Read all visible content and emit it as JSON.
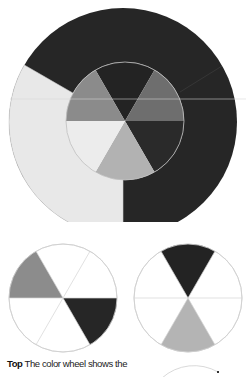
{
  "caption": {
    "lead": "Top",
    "text": " The color wheel shows the"
  },
  "colors": {
    "dark": "#252525",
    "dark_mid": "#2e2e2e",
    "mid_dark": "#6f6f6f",
    "mid": "#8a8a8a",
    "light_mid": "#b3b3b3",
    "light": "#e6e6e6",
    "outline": "#c8c8c8",
    "paper": "#ffffff"
  },
  "figures": {
    "main_wheel": {
      "outer_ring": [
        {
          "name": "dark-ring-segment",
          "shade": "dark"
        },
        {
          "name": "light-ring-segment",
          "shade": "light"
        }
      ],
      "inner_wedges": [
        {
          "position": "top",
          "shade": "dark"
        },
        {
          "position": "upper-right",
          "shade": "mid_dark"
        },
        {
          "position": "lower-right",
          "shade": "dark"
        },
        {
          "position": "bottom",
          "shade": "light_mid"
        },
        {
          "position": "lower-left",
          "shade": "light"
        },
        {
          "position": "upper-left",
          "shade": "mid"
        }
      ]
    },
    "small_wheel_left": {
      "filled_wedges": [
        {
          "position": "upper-left",
          "shade": "mid"
        },
        {
          "position": "lower-right",
          "shade": "dark"
        }
      ]
    },
    "small_wheel_right": {
      "filled_wedges": [
        {
          "position": "top",
          "shade": "dark"
        },
        {
          "position": "bottom",
          "shade": "light_mid"
        }
      ]
    }
  }
}
